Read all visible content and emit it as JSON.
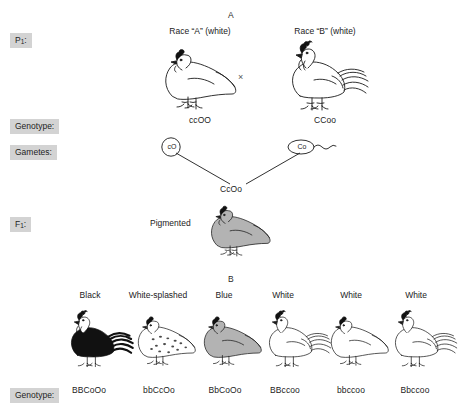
{
  "figure": {
    "panel_a_letter": "A",
    "panel_b_letter": "B"
  },
  "panel_a": {
    "row_labels": {
      "parents": "P",
      "parents_sub": "1",
      "parents_suffix": ":",
      "genotype": "Genotype:",
      "gametes": "Gametes:",
      "f1": "F",
      "f1_sub": "1",
      "f1_suffix": ":"
    },
    "parents": [
      {
        "caption": "Race “A” (white)",
        "genotype": "ccOO",
        "gamete": "cO",
        "gamete_type": "egg",
        "sex": "hen",
        "fill": "#ffffff"
      },
      {
        "caption": "Race “B” (white)",
        "genotype": "CCoo",
        "gamete": "Co",
        "gamete_type": "sperm",
        "sex": "rooster",
        "fill": "#ffffff"
      }
    ],
    "cross_symbol": "×",
    "offspring": {
      "genotype": "CcOo",
      "phenotype": "Pigmented",
      "sex": "hen",
      "fill": "#b3b3b3"
    }
  },
  "panel_b": {
    "genotype_label": "Genotype:",
    "birds": [
      {
        "phenotype": "Black",
        "genotype": "BBCoOo",
        "sex": "rooster",
        "fill": "#111111",
        "pattern": "solid"
      },
      {
        "phenotype": "White-splashed",
        "genotype": "bbCcOo",
        "sex": "hen",
        "fill": "#ffffff",
        "pattern": "splashed"
      },
      {
        "phenotype": "Blue",
        "genotype": "BbCoOo",
        "sex": "hen",
        "fill": "#b3b3b3",
        "pattern": "solid"
      },
      {
        "phenotype": "White",
        "genotype": "BBccoo",
        "sex": "rooster",
        "fill": "#ffffff",
        "pattern": "solid"
      },
      {
        "phenotype": "White",
        "genotype": "bbccoo",
        "sex": "hen",
        "fill": "#ffffff",
        "pattern": "solid"
      },
      {
        "phenotype": "White",
        "genotype": "Bbccoo",
        "sex": "rooster",
        "fill": "#ffffff",
        "pattern": "solid"
      }
    ]
  },
  "colors": {
    "ink": "#1a1a1a",
    "label_bg": "#d3d3d3",
    "pigmented_gray": "#b3b3b3",
    "black_bird": "#111111",
    "white_bird": "#ffffff"
  }
}
